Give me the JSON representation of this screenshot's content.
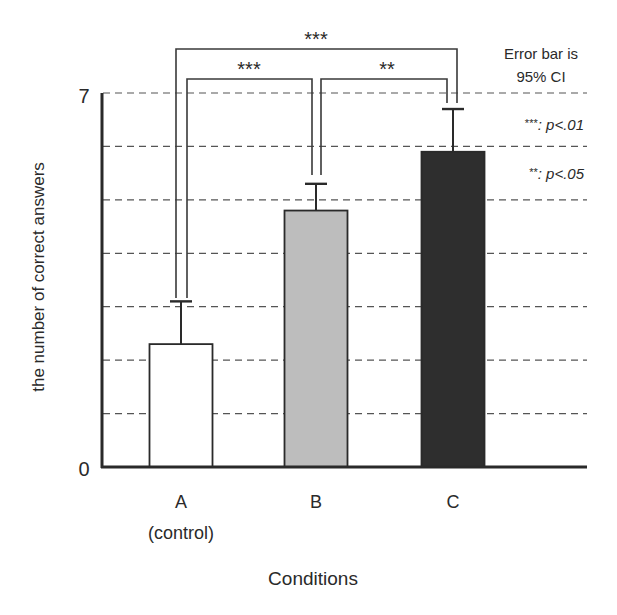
{
  "chart_data": {
    "type": "bar",
    "title": "",
    "xlabel": "Conditions",
    "ylabel": "the number of correct answers",
    "ylim": [
      0,
      7
    ],
    "yticks": [
      0,
      7
    ],
    "ytick_labels": [
      "0",
      "7"
    ],
    "grid": {
      "on": true,
      "style": "dashed",
      "step": 1
    },
    "categories": [
      "A",
      "B",
      "C"
    ],
    "category_sublabels": [
      "(control)",
      "",
      ""
    ],
    "values": [
      2.3,
      4.8,
      5.9
    ],
    "error_upper": [
      3.1,
      5.3,
      6.7
    ],
    "error_type": "95% CI",
    "bar_colors": [
      "#ffffff",
      "#bdbdbd",
      "#2e2e2e"
    ],
    "significance": [
      {
        "from": "A",
        "to": "B",
        "label": "***"
      },
      {
        "from": "B",
        "to": "C",
        "label": "**"
      },
      {
        "from": "A",
        "to": "C",
        "label": "***"
      }
    ],
    "annotations": {
      "error_note_line1": "Error bar is",
      "error_note_line2": "95% CI",
      "legend_p01_stars": "***",
      "legend_p01_text": ": p<.01",
      "legend_p05_stars": "**",
      "legend_p05_text": ": p<.05"
    }
  }
}
